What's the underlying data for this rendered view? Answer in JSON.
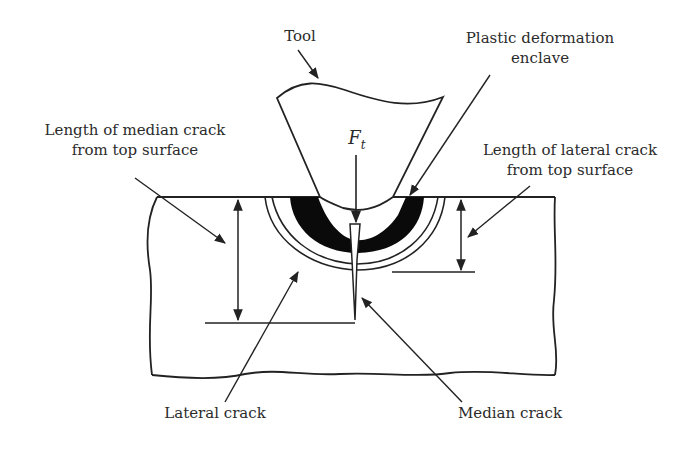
{
  "figure": {
    "labels": {
      "tool": "Tool",
      "plastic_deformation_line1": "Plastic deformation",
      "plastic_deformation_line2": "enclave",
      "median_length_line1": "Length of median crack",
      "median_length_line2": "from top surface",
      "lateral_length_line1": "Length of lateral crack",
      "lateral_length_line2": "from top surface",
      "force_symbol": "F",
      "force_subscript": "t",
      "lateral_crack": "Lateral crack",
      "median_crack": "Median crack"
    },
    "colors": {
      "stroke": "#222222",
      "fill_dark": "#0a0a0a",
      "text": "#2b2b2b",
      "background": "#ffffff"
    }
  }
}
